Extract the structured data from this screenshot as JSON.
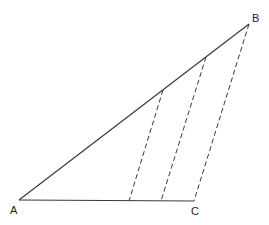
{
  "diagram": {
    "type": "geometry-triangle",
    "points": {
      "A": {
        "label": "A",
        "x": 19,
        "y": 200
      },
      "B": {
        "label": "B",
        "x": 249,
        "y": 24
      },
      "C": {
        "label": "C",
        "x": 194,
        "y": 201
      }
    },
    "solid_segments": [
      {
        "from": "A",
        "to": "B"
      },
      {
        "from": "A",
        "to": "C"
      }
    ],
    "dashed_segments": [
      {
        "from": [
          163,
          90
        ],
        "to": [
          129,
          201
        ]
      },
      {
        "from": [
          206,
          57
        ],
        "to": [
          161,
          201
        ]
      },
      {
        "from": "B",
        "to": "C"
      }
    ],
    "labels": {
      "a": "A",
      "b": "B",
      "c": "C"
    }
  }
}
